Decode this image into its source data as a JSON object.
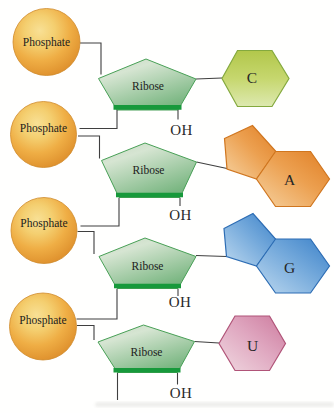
{
  "diagram_type": "RNA nucleotide chain structure",
  "nucleotides": [
    {
      "phosphate_label": "Phosphate",
      "sugar_label": "Ribose",
      "hydroxyl_label": "OH",
      "base": {
        "letter": "C",
        "rings": "single-hexagon",
        "color": "#c6d76e"
      }
    },
    {
      "phosphate_label": "Phosphate",
      "sugar_label": "Ribose",
      "hydroxyl_label": "OH",
      "base": {
        "letter": "A",
        "rings": "fused-pentagon-hexagon",
        "color": "#eca455"
      }
    },
    {
      "phosphate_label": "Phosphate",
      "sugar_label": "Ribose",
      "hydroxyl_label": "OH",
      "base": {
        "letter": "G",
        "rings": "fused-pentagon-hexagon",
        "color": "#74a9db"
      }
    },
    {
      "phosphate_label": "Phosphate",
      "sugar_label": "Ribose",
      "hydroxyl_label": "OH",
      "base": {
        "letter": "U",
        "rings": "single-hexagon",
        "color": "#dfa6bf"
      }
    }
  ],
  "colors": {
    "phosphate_sphere": "#efae45",
    "ribose_fill": "#a9cfa9",
    "ribose_bottom_edge": "#17993b",
    "bond_line": "#3f3f3f"
  }
}
